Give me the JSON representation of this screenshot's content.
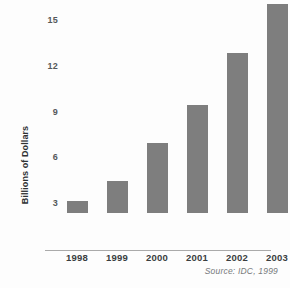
{
  "chart_data": {
    "type": "bar",
    "title": "",
    "subtitle": "",
    "xlabel": "",
    "ylabel": "Billions of Dollars",
    "categories": [
      "1998",
      "1999",
      "2000",
      "2001",
      "2002",
      "2003"
    ],
    "values": [
      0.8,
      2.1,
      4.6,
      7.1,
      10.5,
      13.7
    ],
    "series": [
      {
        "name": "Billions of Dollars",
        "values": [
          0.8,
          2.1,
          4.6,
          7.1,
          10.5,
          13.7
        ]
      }
    ],
    "ylim": [
      0,
      15
    ],
    "yticks": [
      3,
      6,
      9,
      12,
      15
    ],
    "ytick_labels": [
      "3",
      "6",
      "9",
      "12",
      "15"
    ],
    "grid": false,
    "legend": false,
    "legend_position": "none",
    "annotations": [
      "Source: IDC, 1999"
    ],
    "bar_color": "#7e7e7e",
    "axis_color": "#aaaaaa",
    "background_color": "#fdfdfd",
    "text_color": "#3a3d3f"
  },
  "chart": {
    "source_note": "Source: IDC, 1999",
    "y_axis_title": "Billions of Dollars"
  }
}
